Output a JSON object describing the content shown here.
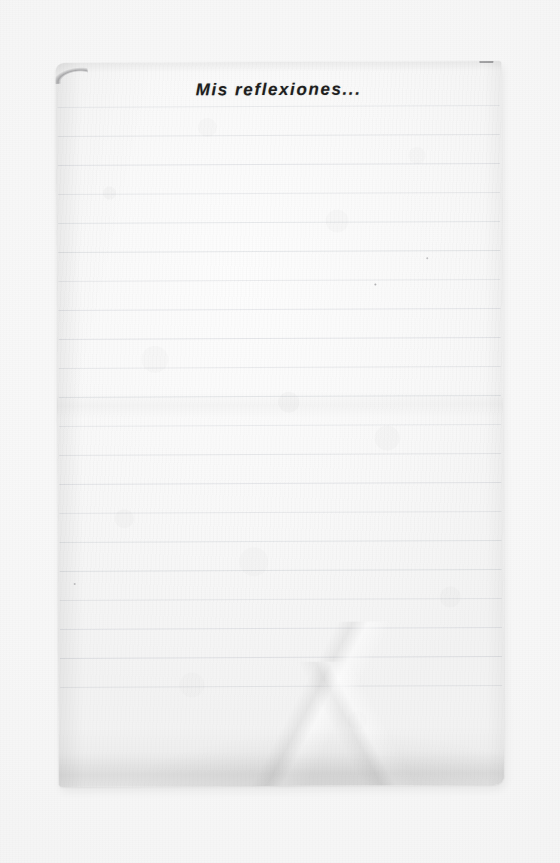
{
  "document": {
    "type": "scanned-ruled-notebook-page",
    "heading": "Mis reflexiones...",
    "body_text": "",
    "body_state": "blank",
    "ruled_line_count": 21,
    "ruled_line_spacing_px": 29,
    "colors": {
      "scanner_background": "#f6f6f6",
      "paper": "#fafafa",
      "rule_line": "rgba(120,130,145,0.17)",
      "heading_text": "#1e1e1e",
      "shadow": "rgba(0,0,0,0.06)"
    },
    "artifacts": {
      "top_left_corner": "worn-rounded-smudge",
      "top_right_corner": "small-dark-nick",
      "lower_area": "diagonal-fold-creases",
      "bottom_edge": "curl-shadow"
    }
  }
}
